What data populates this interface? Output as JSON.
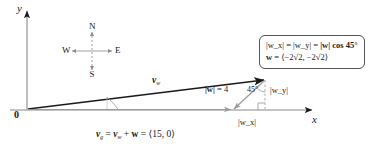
{
  "figure": {
    "type": "vector-diagram",
    "axes": {
      "x_label": "x",
      "y_label": "y",
      "origin_label": "0"
    },
    "compass": {
      "north": "N",
      "south": "S",
      "east": "E",
      "west": "W"
    },
    "vectors": [
      {
        "name": "v_w",
        "label_base": "v",
        "label_sub": "w",
        "from": [
          0,
          0
        ],
        "to": [
          265,
          80
        ]
      },
      {
        "name": "w",
        "label_base": "w",
        "magnitude_label": "|w| = 4",
        "from": [
          265,
          80
        ],
        "to": [
          233,
          110
        ]
      },
      {
        "name": "v_g",
        "label_base": "v",
        "label_sub": "g"
      }
    ],
    "annotations": {
      "w_magnitude": "= 4",
      "w_magnitude_prefix": "|w|",
      "angle": "45°",
      "component_y": "|w_y|",
      "component_x": "|w_x|"
    },
    "equation_box": {
      "line1_lhs": "|w_x|",
      "line1_mid": "|w_y|",
      "line1_rhs_prefix": "|w| cos 45°",
      "line2_lhs": "w",
      "line2_rhs": "⟨−2√2, −2√2⟩"
    },
    "bottom_equation": {
      "lhs_base": "v",
      "lhs_sub": "g",
      "term1_base": "v",
      "term1_sub": "w",
      "term2": "w",
      "result": "⟨15, 0⟩"
    },
    "colors": {
      "ink": "#1a1a1a",
      "axis": "#8a8a8a",
      "vector_light": "#9a9a9a",
      "box_border": "#555555"
    }
  }
}
